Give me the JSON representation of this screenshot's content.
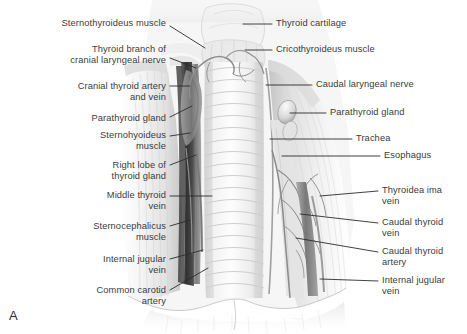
{
  "figure": {
    "letter": "A"
  },
  "labels_left": [
    {
      "id": "sternothyroideus-muscle",
      "text": "Sternothyroideus muscle",
      "x": 18,
      "y": 18,
      "w": 148,
      "leader": [
        [
          170,
          26
        ],
        [
          205,
          48
        ]
      ]
    },
    {
      "id": "thyroid-branch-cranial-laryngeal-nerve",
      "text": "Thyroid branch of\ncranial laryngeal nerve",
      "x": 18,
      "y": 44,
      "w": 148,
      "leader": [
        [
          170,
          58
        ],
        [
          196,
          68
        ]
      ]
    },
    {
      "id": "cranial-thyroid-artery-and-vein",
      "text": "Cranial thyroid artery\nand vein",
      "x": 18,
      "y": 81,
      "w": 148,
      "leader": [
        [
          170,
          86
        ],
        [
          190,
          86
        ]
      ]
    },
    {
      "id": "parathyroid-gland-left",
      "text": "Parathyroid gland",
      "x": 18,
      "y": 113,
      "w": 148,
      "leader": [
        [
          170,
          117
        ],
        [
          192,
          106
        ]
      ]
    },
    {
      "id": "sternohyoideus-muscle",
      "text": "Sternohyoideus\nmuscle",
      "x": 18,
      "y": 130,
      "w": 148,
      "leader": [
        [
          170,
          136
        ],
        [
          190,
          133
        ]
      ]
    },
    {
      "id": "right-lobe-of-thyroid-gland",
      "text": "Right lobe of\nthyroid gland",
      "x": 18,
      "y": 160,
      "w": 148,
      "leader": [
        [
          170,
          165
        ],
        [
          196,
          155
        ]
      ]
    },
    {
      "id": "middle-thyroid-vein",
      "text": "Middle thyroid\nvein",
      "x": 18,
      "y": 190,
      "w": 148,
      "leader": [
        [
          170,
          196
        ],
        [
          212,
          196
        ]
      ]
    },
    {
      "id": "sternocephalicus-muscle",
      "text": "Sternocephalicus\nmuscle",
      "x": 18,
      "y": 221,
      "w": 148,
      "leader": [
        [
          170,
          226
        ],
        [
          190,
          220
        ]
      ]
    },
    {
      "id": "internal-jugular-vein-left",
      "text": "Internal jugular\nvein",
      "x": 18,
      "y": 254,
      "w": 148,
      "leader": [
        [
          170,
          259
        ],
        [
          203,
          250
        ]
      ]
    },
    {
      "id": "common-carotid-artery",
      "text": "Common carotid\nartery",
      "x": 18,
      "y": 285,
      "w": 148,
      "leader": [
        [
          170,
          290
        ],
        [
          208,
          268
        ]
      ]
    }
  ],
  "labels_right": [
    {
      "id": "thyroid-cartilage",
      "text": "Thyroid cartilage",
      "x": 276,
      "y": 18,
      "leader": [
        [
          272,
          24
        ],
        [
          243,
          24
        ]
      ]
    },
    {
      "id": "cricothyroideus-muscle",
      "text": "Cricothyroideus muscle",
      "x": 276,
      "y": 44,
      "leader": [
        [
          272,
          50
        ],
        [
          245,
          50
        ]
      ]
    },
    {
      "id": "caudal-laryngeal-nerve",
      "text": "Caudal laryngeal nerve",
      "x": 316,
      "y": 79,
      "leader": [
        [
          312,
          85
        ],
        [
          266,
          85
        ]
      ]
    },
    {
      "id": "parathyroid-gland-right",
      "text": "Parathyroid gland",
      "x": 330,
      "y": 107,
      "leader": [
        [
          326,
          113
        ],
        [
          290,
          113
        ]
      ]
    },
    {
      "id": "trachea",
      "text": "Trachea",
      "x": 356,
      "y": 133,
      "leader": [
        [
          352,
          139
        ],
        [
          270,
          139
        ]
      ]
    },
    {
      "id": "esophagus",
      "text": "Esophagus",
      "x": 384,
      "y": 150,
      "leader": [
        [
          380,
          156
        ],
        [
          282,
          156
        ]
      ]
    },
    {
      "id": "thyroidea-ima-vein",
      "text": "Thyroidea ima\nvein",
      "x": 382,
      "y": 185,
      "leader": [
        [
          378,
          191
        ],
        [
          320,
          196
        ]
      ]
    },
    {
      "id": "caudal-thyroid-vein",
      "text": "Caudal thyroid\nvein",
      "x": 382,
      "y": 217,
      "leader": [
        [
          378,
          223
        ],
        [
          300,
          214
        ]
      ]
    },
    {
      "id": "caudal-thyroid-artery",
      "text": "Caudal thyroid\nartery",
      "x": 382,
      "y": 246,
      "leader": [
        [
          378,
          252
        ],
        [
          296,
          238
        ]
      ]
    },
    {
      "id": "internal-jugular-vein-right",
      "text": "Internal jugular\nvein",
      "x": 382,
      "y": 275,
      "leader": [
        [
          378,
          281
        ],
        [
          320,
          279
        ]
      ]
    }
  ],
  "colors": {
    "background": "#ffffff",
    "label_text": "#3b3b3b",
    "leader_line": "#2b2b2b",
    "trachea_light": "#f5f5f5",
    "trachea_ring": "#c9c9c9",
    "muscle_pale": "#ececec",
    "vessel_dark": "#3e3e3e",
    "vessel_mid": "#8b8b8b",
    "tissue_shadow": "#b9b9b9"
  }
}
